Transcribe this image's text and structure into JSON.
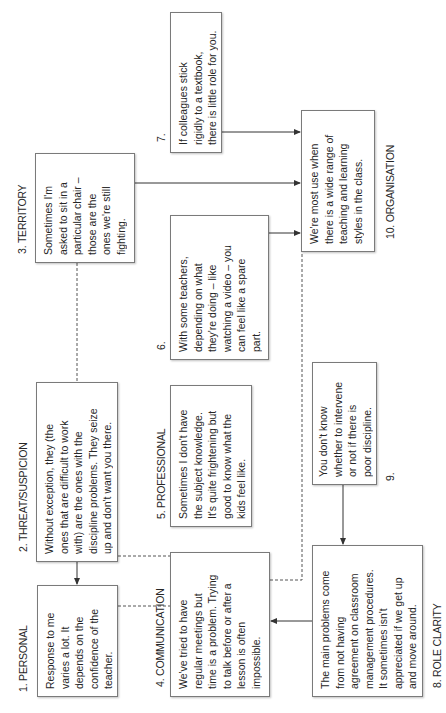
{
  "diagram": {
    "nodes": [
      {
        "id": 1,
        "label": "1. PERSONAL",
        "text": "Response to me\nvaries a lot. It\ndepends on the\nconfidence of the\nteacher."
      },
      {
        "id": 2,
        "label": "2. THREAT/SUSPICION",
        "text": "Without exception, they (the\nones that are difficult to work\nwith) are the ones with the\ndiscipline problems. They seize\nup and don't want you there."
      },
      {
        "id": 3,
        "label": "3. TERRITORY",
        "text": "Sometimes I'm\nasked to sit in a\nparticular chair –\nthose are the\nones we're still\nfighting."
      },
      {
        "id": 4,
        "label": "4. COMMUNICATION",
        "text": "We've tried to have\nregular meetings but\ntime is a problem. Trying\nto talk before or after a\nlesson is often\nimpossible."
      },
      {
        "id": 5,
        "label": "5. PROFESSIONAL",
        "text": "Sometimes I don't have\nthe subject knowledge.\nIt's quite frightening but\ngood to know what the\nkids feel like."
      },
      {
        "id": 6,
        "label": "6.",
        "text": "With some teachers,\ndepending on what\nthey're doing – like\nwatching a video – you\ncan feel like a spare\npart."
      },
      {
        "id": 7,
        "label": "7.",
        "text": "If colleagues stick\nrigidly to a textbook,\nthere is little role for you."
      },
      {
        "id": 8,
        "label": "8. ROLE CLARITY",
        "text": "The main problems come\nfrom not having\nagreement on classroom\nmanagement procedures.\nIt sometimes isn't\nappreciated if we get up\nand move around."
      },
      {
        "id": 9,
        "label": "9.",
        "text": "You don't know\nwhether to intervene\nor not if there is\npoor discipline."
      },
      {
        "id": 10,
        "label": "10. ORGANISATION",
        "text": "We're most use when\nthere is a wide range of\nteaching and learning\nstyles in the class."
      }
    ],
    "connections": [
      {
        "from": 3,
        "to": 10,
        "style": "solid-arrow"
      },
      {
        "from": 7,
        "to": 10,
        "style": "solid-arrow"
      },
      {
        "from": 6,
        "to": 10,
        "style": "solid-arrow"
      },
      {
        "from": 3,
        "to": 2,
        "style": "dashed"
      },
      {
        "from": 2,
        "to": 1,
        "style": "solid-arrow"
      },
      {
        "from": 2,
        "to": 4,
        "style": "dashed"
      },
      {
        "from": 1,
        "to": 4,
        "style": "dashed"
      },
      {
        "from": 4,
        "to": 10,
        "style": "dashed"
      },
      {
        "from": 9,
        "to": 8,
        "style": "solid-arrow"
      },
      {
        "from": 8,
        "to": 4,
        "style": "solid-arrow"
      }
    ],
    "colors": {
      "line": "#333333",
      "dashed": "#555555",
      "border": "#7a7a7a",
      "text": "#262626"
    }
  }
}
